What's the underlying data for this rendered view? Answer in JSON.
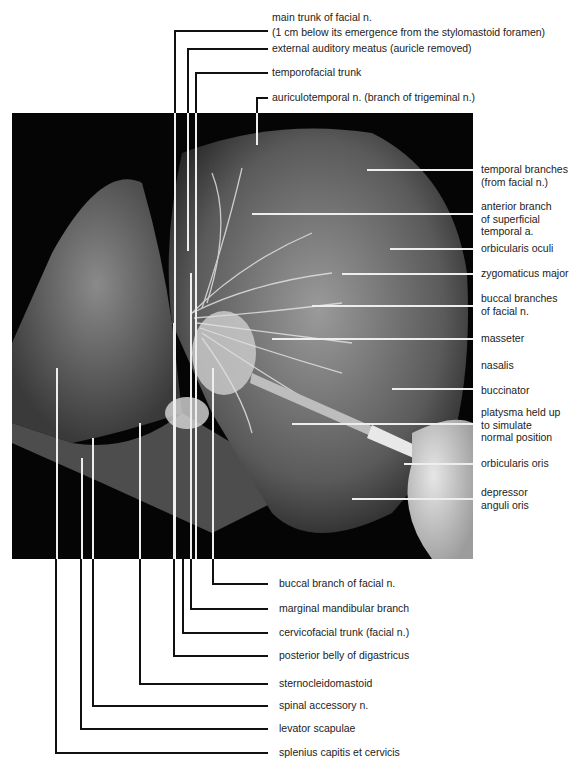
{
  "figure": {
    "top_labels": [
      {
        "id": "main-trunk-facial",
        "lines": [
          "main trunk of facial n.",
          "(1 cm below its emergence from the stylomastoid foramen)"
        ]
      },
      {
        "id": "external-auditory-meatus",
        "lines": [
          "external auditory meatus (auricle removed)"
        ]
      },
      {
        "id": "temporofacial-trunk",
        "lines": [
          "temporofacial trunk"
        ]
      },
      {
        "id": "auriculotemporal",
        "lines": [
          "auriculotemporal n. (branch of trigeminal n.)"
        ]
      }
    ],
    "right_labels": [
      {
        "id": "temporal-branches",
        "lines": [
          "temporal branches",
          "(from facial n.)"
        ]
      },
      {
        "id": "anterior-branch-sta",
        "lines": [
          "anterior branch",
          "of superficial",
          "temporal a."
        ]
      },
      {
        "id": "orbicularis-oculi",
        "lines": [
          "orbicularis oculi"
        ]
      },
      {
        "id": "zygomaticus-major",
        "lines": [
          "zygomaticus major"
        ]
      },
      {
        "id": "buccal-branches",
        "lines": [
          "buccal branches",
          "of facial n."
        ]
      },
      {
        "id": "masseter",
        "lines": [
          "masseter"
        ]
      },
      {
        "id": "nasalis",
        "lines": [
          "nasalis"
        ]
      },
      {
        "id": "buccinator",
        "lines": [
          "buccinator"
        ]
      },
      {
        "id": "platysma",
        "lines": [
          "platysma held up",
          "to simulate",
          "normal position"
        ]
      },
      {
        "id": "orbicularis-oris",
        "lines": [
          "orbicularis oris"
        ]
      },
      {
        "id": "depressor-anguli-oris",
        "lines": [
          "depressor",
          "anguli oris"
        ]
      }
    ],
    "bottom_labels": [
      {
        "id": "buccal-branch",
        "lines": [
          "buccal branch of facial n."
        ]
      },
      {
        "id": "marginal-mandibular",
        "lines": [
          "marginal mandibular branch"
        ]
      },
      {
        "id": "cervicofacial-trunk",
        "lines": [
          "cervicofacial trunk (facial n.)"
        ]
      },
      {
        "id": "posterior-belly-digastricus",
        "lines": [
          "posterior belly of digastricus"
        ]
      },
      {
        "id": "sternocleidomastoid",
        "lines": [
          "sternocleidomastoid"
        ]
      },
      {
        "id": "spinal-accessory",
        "lines": [
          "spinal accessory n."
        ]
      },
      {
        "id": "levator-scapulae",
        "lines": [
          "levator scapulae"
        ]
      },
      {
        "id": "splenius",
        "lines": [
          "splenius capitis et cervicis"
        ]
      }
    ]
  }
}
